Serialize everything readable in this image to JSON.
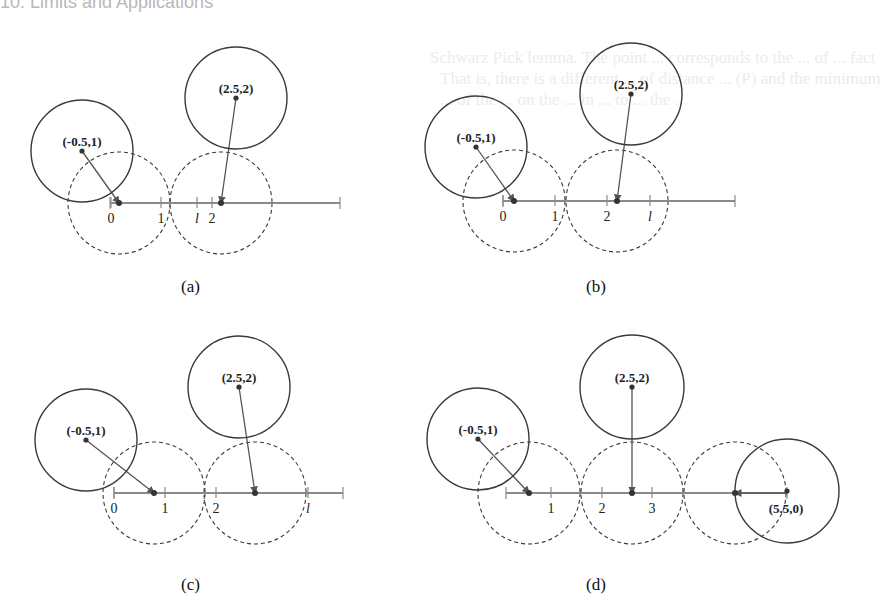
{
  "page": {
    "header_fragment": "10. Limits and Applications",
    "background_bleed_lines": [
      "Schwarz Pick lemma. The point ... corresponds to the ... of ... fact",
      "That is, there is a different ... of distance ... (P) and the minimum",
      "... of the ... on the ... in ... to ... the ... "
    ]
  },
  "figure": {
    "panels": [
      {
        "id": "a",
        "caption": "(a)",
        "caption_pos": [
          181,
          293
        ],
        "axis": {
          "y": 203,
          "x_start": 110,
          "x_end": 340
        },
        "ticks": [
          {
            "x": 111,
            "label": "0",
            "italic": false
          },
          {
            "x": 161,
            "label": "1",
            "italic": false
          },
          {
            "x": 197,
            "label": "l",
            "italic": true
          },
          {
            "x": 212,
            "label": "2",
            "italic": false
          }
        ],
        "solid_circles": [
          {
            "cx": 82,
            "cy": 151,
            "r": 51,
            "label": "(-0.5,1)",
            "label_x": 82,
            "label_y": 146
          },
          {
            "cx": 236,
            "cy": 98,
            "r": 51,
            "label": "(2.5,2)",
            "label_x": 236,
            "label_y": 93
          }
        ],
        "dashed_circles": [
          {
            "cx": 119,
            "cy": 203,
            "r": 51
          },
          {
            "cx": 221,
            "cy": 203,
            "r": 51
          }
        ],
        "projections": [
          {
            "from": [
              82,
              151
            ],
            "to": [
              119,
              203
            ]
          },
          {
            "from": [
              236,
              98
            ],
            "to": [
              221,
              203
            ]
          }
        ]
      },
      {
        "id": "b",
        "caption": "(b)",
        "caption_pos": [
          586,
          293
        ],
        "axis": {
          "y": 201,
          "x_start": 503,
          "x_end": 735
        },
        "ticks": [
          {
            "x": 503,
            "label": "0",
            "italic": false
          },
          {
            "x": 555,
            "label": "1",
            "italic": false
          },
          {
            "x": 607,
            "label": "2",
            "italic": false
          },
          {
            "x": 650,
            "label": "l",
            "italic": true
          }
        ],
        "solid_circles": [
          {
            "cx": 476,
            "cy": 147,
            "r": 51,
            "label": "(-0.5,1)",
            "label_x": 476,
            "label_y": 142
          },
          {
            "cx": 631,
            "cy": 94,
            "r": 51,
            "label": "(2.5,2)",
            "label_x": 631,
            "label_y": 89
          }
        ],
        "dashed_circles": [
          {
            "cx": 514,
            "cy": 201,
            "r": 51
          },
          {
            "cx": 617,
            "cy": 201,
            "r": 51
          }
        ],
        "projections": [
          {
            "from": [
              476,
              147
            ],
            "to": [
              514,
              201
            ]
          },
          {
            "from": [
              631,
              94
            ],
            "to": [
              617,
              201
            ]
          }
        ]
      },
      {
        "id": "c",
        "caption": "(c)",
        "caption_pos": [
          181,
          591
        ],
        "axis": {
          "y": 493,
          "x_start": 114,
          "x_end": 343
        },
        "ticks": [
          {
            "x": 114,
            "label": "0",
            "italic": false
          },
          {
            "x": 165,
            "label": "1",
            "italic": false
          },
          {
            "x": 216,
            "label": "2",
            "italic": false
          },
          {
            "x": 308,
            "label": "l",
            "italic": true
          }
        ],
        "solid_circles": [
          {
            "cx": 86,
            "cy": 440,
            "r": 51,
            "label": "(-0.5,1)",
            "label_x": 86,
            "label_y": 435
          },
          {
            "cx": 239,
            "cy": 387,
            "r": 51,
            "label": "(2.5,2)",
            "label_x": 239,
            "label_y": 382
          }
        ],
        "dashed_circles": [
          {
            "cx": 154,
            "cy": 493,
            "r": 51
          },
          {
            "cx": 255,
            "cy": 493,
            "r": 51
          }
        ],
        "projections": [
          {
            "from": [
              86,
              440
            ],
            "to": [
              154,
              493
            ]
          },
          {
            "from": [
              239,
              387
            ],
            "to": [
              255,
              493
            ]
          }
        ]
      },
      {
        "id": "d",
        "caption": "(d)",
        "caption_pos": [
          586,
          591
        ],
        "axis": {
          "y": 493,
          "x_start": 506,
          "x_end": 787
        },
        "ticks": [
          {
            "x": 551,
            "label": "1",
            "italic": false
          },
          {
            "x": 602,
            "label": "2",
            "italic": false
          },
          {
            "x": 652,
            "label": "3",
            "italic": false
          }
        ],
        "solid_circles": [
          {
            "cx": 478,
            "cy": 439,
            "r": 51,
            "label": "(-0.5,1)",
            "label_x": 478,
            "label_y": 434
          },
          {
            "cx": 632,
            "cy": 387,
            "r": 52,
            "label": "(2.5,2)",
            "label_x": 632,
            "label_y": 382
          },
          {
            "cx": 787,
            "cy": 491,
            "r": 52,
            "label": "(5.5,0)",
            "label_x": 786,
            "label_y": 513
          }
        ],
        "dashed_circles": [
          {
            "cx": 529,
            "cy": 493,
            "r": 51
          },
          {
            "cx": 632,
            "cy": 493,
            "r": 51
          },
          {
            "cx": 735,
            "cy": 493,
            "r": 51
          }
        ],
        "projections": [
          {
            "from": [
              478,
              439
            ],
            "to": [
              529,
              493
            ]
          },
          {
            "from": [
              632,
              387
            ],
            "to": [
              632,
              493
            ]
          },
          {
            "from": [
              787,
              493
            ],
            "to": [
              735,
              493
            ]
          }
        ]
      }
    ],
    "colors": {
      "solid_circle": "#3a3a3a",
      "dashed_circle": "#3a3a3a",
      "axis": "#8a8a8a",
      "projection": "#555555",
      "dot": "#333333"
    }
  }
}
